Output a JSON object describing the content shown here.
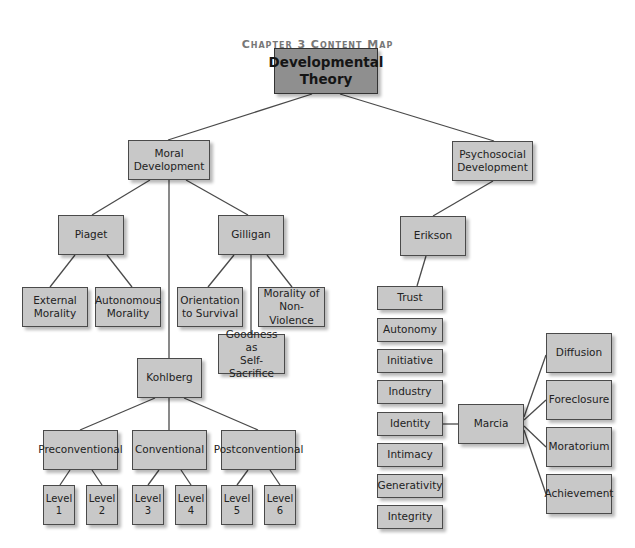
{
  "title": "Chapter 3 Content Map",
  "colors": {
    "node_fill": "#c8c8c8",
    "root_fill": "#8f8f8f",
    "border": "#4a4a4a",
    "title_color": "#777777",
    "line": "#4a4a4a"
  },
  "nodes": {
    "root": {
      "label": "Developmental\nTheory",
      "x": 274,
      "y": 48,
      "w": 104,
      "h": 46
    },
    "moral": {
      "label": "Moral\nDevelopment",
      "x": 128,
      "y": 140,
      "w": 82,
      "h": 40
    },
    "psychosocial": {
      "label": "Psychosocial\nDevelopment",
      "x": 452,
      "y": 141,
      "w": 81,
      "h": 40
    },
    "piaget": {
      "label": "Piaget",
      "x": 58,
      "y": 215,
      "w": 66,
      "h": 40
    },
    "gilligan": {
      "label": "Gilligan",
      "x": 218,
      "y": 215,
      "w": 66,
      "h": 40
    },
    "external": {
      "label": "External\nMorality",
      "x": 22,
      "y": 287,
      "w": 66,
      "h": 40
    },
    "autonomous": {
      "label": "Autonomous\nMorality",
      "x": 95,
      "y": 287,
      "w": 66,
      "h": 40
    },
    "orientation": {
      "label": "Orientation\nto Survival",
      "x": 177,
      "y": 287,
      "w": 66,
      "h": 40
    },
    "nonviolence": {
      "label": "Morality of\nNon-Violence",
      "x": 258,
      "y": 287,
      "w": 67,
      "h": 40
    },
    "goodness": {
      "label": "Goodness as\nSelf-Sacrifice",
      "x": 218,
      "y": 334,
      "w": 67,
      "h": 40
    },
    "kohlberg": {
      "label": "Kohlberg",
      "x": 137,
      "y": 358,
      "w": 65,
      "h": 40
    },
    "preconventional": {
      "label": "Preconventional",
      "x": 43,
      "y": 430,
      "w": 75,
      "h": 40
    },
    "conventional": {
      "label": "Conventional",
      "x": 132,
      "y": 430,
      "w": 75,
      "h": 40
    },
    "postconventional": {
      "label": "Postconventional",
      "x": 221,
      "y": 430,
      "w": 75,
      "h": 40
    },
    "level1": {
      "label": "Level\n1",
      "x": 43,
      "y": 485,
      "w": 32,
      "h": 40
    },
    "level2": {
      "label": "Level\n2",
      "x": 86,
      "y": 485,
      "w": 32,
      "h": 40
    },
    "level3": {
      "label": "Level\n3",
      "x": 132,
      "y": 485,
      "w": 32,
      "h": 40
    },
    "level4": {
      "label": "Level\n4",
      "x": 175,
      "y": 485,
      "w": 32,
      "h": 40
    },
    "level5": {
      "label": "Level\n5",
      "x": 221,
      "y": 485,
      "w": 32,
      "h": 40
    },
    "level6": {
      "label": "Level\n6",
      "x": 264,
      "y": 485,
      "w": 32,
      "h": 40
    },
    "erikson": {
      "label": "Erikson",
      "x": 400,
      "y": 216,
      "w": 66,
      "h": 40
    },
    "trust": {
      "label": "Trust",
      "x": 377,
      "y": 286,
      "w": 66,
      "h": 24
    },
    "autonomy": {
      "label": "Autonomy",
      "x": 377,
      "y": 318,
      "w": 66,
      "h": 24
    },
    "initiative": {
      "label": "Initiative",
      "x": 377,
      "y": 349,
      "w": 66,
      "h": 24
    },
    "industry": {
      "label": "Industry",
      "x": 377,
      "y": 380,
      "w": 66,
      "h": 24
    },
    "identity": {
      "label": "Identity",
      "x": 377,
      "y": 412,
      "w": 66,
      "h": 24
    },
    "intimacy": {
      "label": "Intimacy",
      "x": 377,
      "y": 443,
      "w": 66,
      "h": 24
    },
    "generativity": {
      "label": "Generativity",
      "x": 377,
      "y": 474,
      "w": 66,
      "h": 24
    },
    "integrity": {
      "label": "Integrity",
      "x": 377,
      "y": 505,
      "w": 66,
      "h": 24
    },
    "marcia": {
      "label": "Marcia",
      "x": 458,
      "y": 404,
      "w": 66,
      "h": 40
    },
    "diffusion": {
      "label": "Diffusion",
      "x": 546,
      "y": 333,
      "w": 66,
      "h": 40
    },
    "foreclosure": {
      "label": "Foreclosure",
      "x": 546,
      "y": 380,
      "w": 66,
      "h": 40
    },
    "moratorium": {
      "label": "Moratorium",
      "x": 546,
      "y": 427,
      "w": 66,
      "h": 40
    },
    "achievement": {
      "label": "Achievement",
      "x": 546,
      "y": 474,
      "w": 66,
      "h": 40
    }
  },
  "edges": [
    [
      312,
      94,
      168,
      140
    ],
    [
      340,
      94,
      494,
      141
    ],
    [
      150,
      180,
      92,
      215
    ],
    [
      169,
      180,
      169,
      358
    ],
    [
      186,
      180,
      248,
      215
    ],
    [
      75,
      255,
      50,
      287
    ],
    [
      107,
      255,
      132,
      287
    ],
    [
      234,
      255,
      208,
      287
    ],
    [
      251,
      255,
      251,
      334
    ],
    [
      267,
      255,
      292,
      287
    ],
    [
      155,
      398,
      80,
      430
    ],
    [
      169,
      398,
      169,
      430
    ],
    [
      184,
      398,
      258,
      430
    ],
    [
      70,
      470,
      60,
      485
    ],
    [
      92,
      470,
      102,
      485
    ],
    [
      159,
      470,
      148,
      485
    ],
    [
      181,
      470,
      191,
      485
    ],
    [
      248,
      470,
      237,
      485
    ],
    [
      270,
      470,
      280,
      485
    ],
    [
      493,
      181,
      433,
      216
    ],
    [
      426,
      256,
      417,
      286
    ],
    [
      443,
      424,
      458,
      424
    ],
    [
      524,
      417,
      546,
      355
    ],
    [
      524,
      420,
      546,
      400
    ],
    [
      524,
      426,
      546,
      447
    ],
    [
      524,
      430,
      546,
      494
    ]
  ]
}
